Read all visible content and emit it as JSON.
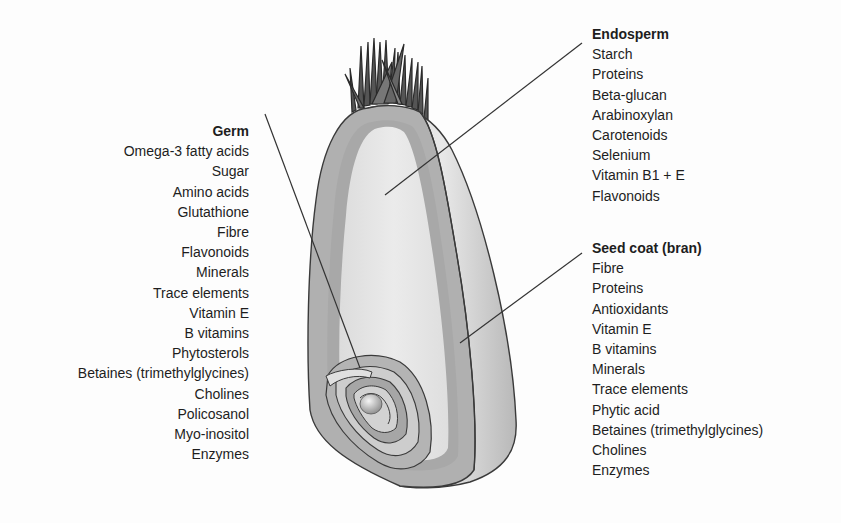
{
  "diagram": {
    "colors": {
      "background": "#fdfdfd",
      "text": "#1e1e1e",
      "outer_coat": "#b4b4b4",
      "bran_layer": "#a9a9a9",
      "endosperm": "#e4e4e4",
      "right_face": "#cdcdcd",
      "outline": "#3a3a3a",
      "leader_line": "#333333"
    }
  },
  "germ": {
    "title": "Germ",
    "items": [
      "Omega-3 fatty acids",
      "Sugar",
      "Amino acids",
      "Glutathione",
      "Fibre",
      "Flavonoids",
      "Minerals",
      "Trace elements",
      "Vitamin E",
      "B vitamins",
      "Phytosterols",
      "Betaines (trimethylglycines)",
      "Cholines",
      "Policosanol",
      "Myo-inositol",
      "Enzymes"
    ]
  },
  "endosperm": {
    "title": "Endosperm",
    "items": [
      "Starch",
      "Proteins",
      "Beta-glucan",
      "Arabinoxylan",
      "Carotenoids",
      "Selenium",
      "Vitamin B1 + E",
      "Flavonoids"
    ]
  },
  "seed_coat": {
    "title": "Seed coat (bran)",
    "items": [
      "Fibre",
      "Proteins",
      "Antioxidants",
      "Vitamin E",
      "B vitamins",
      "Minerals",
      "Trace elements",
      "Phytic acid",
      "Betaines (trimethylglycines)",
      "Cholines",
      "Enzymes"
    ]
  }
}
